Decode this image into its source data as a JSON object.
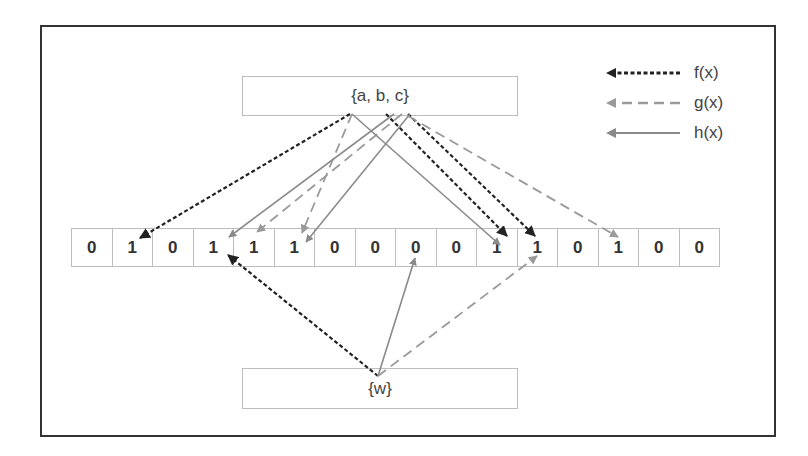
{
  "diagram": {
    "top_set": {
      "label": "{a, b, c}"
    },
    "bottom_set": {
      "label": "{w}"
    },
    "bit_array": [
      "0",
      "1",
      "0",
      "1",
      "1",
      "1",
      "0",
      "0",
      "0",
      "0",
      "1",
      "1",
      "0",
      "1",
      "0",
      "0"
    ],
    "legend": [
      {
        "label": "f(x)",
        "style": "dotted",
        "color": "#222222"
      },
      {
        "label": "g(x)",
        "style": "dashed",
        "color": "#9a9a9a"
      },
      {
        "label": "h(x)",
        "style": "solid",
        "color": "#8a8a8a"
      }
    ],
    "arrows": [
      {
        "fn": "f",
        "from": [
          350,
          114
        ],
        "to": [
          140,
          238
        ]
      },
      {
        "fn": "f",
        "from": [
          386,
          114
        ],
        "to": [
          507,
          236
        ]
      },
      {
        "fn": "f",
        "from": [
          408,
          114
        ],
        "to": [
          535,
          236
        ]
      },
      {
        "fn": "g",
        "from": [
          352,
          114
        ],
        "to": [
          302,
          233
        ]
      },
      {
        "fn": "g",
        "from": [
          402,
          114
        ],
        "to": [
          257,
          232
        ]
      },
      {
        "fn": "g",
        "from": [
          408,
          116
        ],
        "to": [
          618,
          237
        ]
      },
      {
        "fn": "h",
        "from": [
          394,
          114
        ],
        "to": [
          229,
          237
        ]
      },
      {
        "fn": "h",
        "from": [
          410,
          114
        ],
        "to": [
          306,
          242
        ]
      },
      {
        "fn": "h",
        "from": [
          352,
          114
        ],
        "to": [
          500,
          245
        ]
      },
      {
        "fn": "f",
        "from": [
          378,
          376
        ],
        "to": [
          228,
          255
        ]
      },
      {
        "fn": "h",
        "from": [
          378,
          376
        ],
        "to": [
          415,
          258
        ]
      },
      {
        "fn": "g",
        "from": [
          378,
          376
        ],
        "to": [
          537,
          256
        ]
      }
    ]
  }
}
